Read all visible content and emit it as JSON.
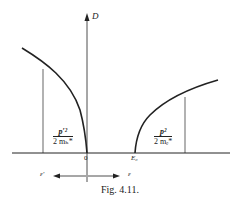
{
  "figure": {
    "caption": "Fig. 4.11.",
    "y_axis_label": "D",
    "origin_label": "0",
    "gap_label": "E₀",
    "left_formula": {
      "numerator": "p′²",
      "denominator": "2 mₕ*"
    },
    "right_formula": {
      "numerator": "p²",
      "denominator": "2 mₑ*"
    },
    "left_arrow_label": "ε′",
    "right_arrow_label": "ε",
    "colors": {
      "ink": "#222222",
      "background": "#ffffff"
    }
  }
}
